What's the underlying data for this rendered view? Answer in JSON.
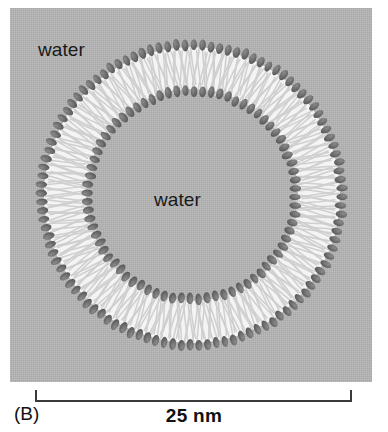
{
  "figure": {
    "panel_letter": "(B)",
    "type": "liposome-cross-section-diagram",
    "labels": {
      "outer_water": "water",
      "inner_water": "water"
    },
    "scale_bar": {
      "length_label": "25 nm",
      "value": 25,
      "unit": "nm"
    },
    "colors": {
      "background": "#ffffff",
      "panel": "#b4b4b4",
      "lipid_head": "#6b6b6b",
      "lipid_tail": "#cfcfcf",
      "tail_region": "#f2f2f2",
      "scale_bar": "#3a3a3a",
      "text": "#111111"
    },
    "geometry": {
      "center_x": 182,
      "center_y": 187,
      "outer_head_radius": 150,
      "inner_head_radius": 104,
      "outer_leaflet_count": 108,
      "inner_leaflet_count": 76
    }
  }
}
